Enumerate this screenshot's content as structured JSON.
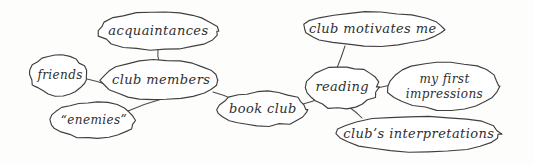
{
  "diagram": {
    "background_color": "#fdfdfc",
    "stroke_color": "#3f3f3f",
    "text_color": "#2e2e2e",
    "style": "hand-drawn sketch",
    "width": 534,
    "height": 164
  },
  "nodes": [
    {
      "id": "acquaintances",
      "label": "acquaintances",
      "cx": 158,
      "cy": 31,
      "rx": 60,
      "ry": 19,
      "font_size": 13,
      "lines": [
        "acquaintances"
      ]
    },
    {
      "id": "friends",
      "label": "friends",
      "cx": 59,
      "cy": 75,
      "rx": 29,
      "ry": 20,
      "font_size": 12,
      "lines": [
        "friends"
      ]
    },
    {
      "id": "club-members",
      "label": "club members",
      "cx": 160,
      "cy": 80,
      "rx": 58,
      "ry": 20,
      "font_size": 13,
      "lines": [
        "club members"
      ]
    },
    {
      "id": "enemies",
      "label": "“enemies”",
      "cx": 93,
      "cy": 120,
      "rx": 42,
      "ry": 18,
      "font_size": 12,
      "lines": [
        "“enemies”"
      ]
    },
    {
      "id": "book-club",
      "label": "book club",
      "cx": 263,
      "cy": 109,
      "rx": 45,
      "ry": 17,
      "font_size": 13,
      "lines": [
        "book club"
      ]
    },
    {
      "id": "club-motivates-me",
      "label": "club motivates me",
      "cx": 373,
      "cy": 29,
      "rx": 70,
      "ry": 17,
      "font_size": 13,
      "lines": [
        "club motivates me"
      ]
    },
    {
      "id": "reading",
      "label": "reading",
      "cx": 342,
      "cy": 87,
      "rx": 36,
      "ry": 21,
      "font_size": 13,
      "lines": [
        "reading"
      ]
    },
    {
      "id": "my-first-impressions",
      "label": "my first impressions",
      "cx": 444,
      "cy": 86,
      "rx": 56,
      "ry": 24,
      "font_size": 12,
      "lines": [
        "my first",
        "impressions"
      ]
    },
    {
      "id": "clubs-interpretations",
      "label": "club's interpretations",
      "cx": 419,
      "cy": 134,
      "rx": 82,
      "ry": 18,
      "font_size": 13,
      "lines": [
        "club’s interpretations"
      ]
    }
  ],
  "edges": [
    {
      "id": "acquaintances--club-members",
      "from": "acquaintances",
      "to": "club-members",
      "x1": 158,
      "y1": 50,
      "x2": 159,
      "y2": 61
    },
    {
      "id": "friends--club-members",
      "from": "friends",
      "to": "club-members",
      "x1": 87,
      "y1": 79,
      "x2": 108,
      "y2": 85
    },
    {
      "id": "enemies--club-members",
      "from": "enemies",
      "to": "club-members",
      "x1": 128,
      "y1": 111,
      "x2": 162,
      "y2": 99
    },
    {
      "id": "club-members--book-club",
      "from": "club-members",
      "to": "book-club",
      "x1": 213,
      "y1": 92,
      "x2": 232,
      "y2": 99
    },
    {
      "id": "book-club--reading",
      "from": "book-club",
      "to": "reading",
      "x1": 303,
      "y1": 104,
      "x2": 319,
      "y2": 99
    },
    {
      "id": "club-motivates-me--reading",
      "from": "club-motivates-me",
      "to": "reading",
      "x1": 345,
      "y1": 46,
      "x2": 337,
      "y2": 68
    },
    {
      "id": "reading--my-first-impressions",
      "from": "reading",
      "to": "my-first-impressions",
      "x1": 377,
      "y1": 88,
      "x2": 391,
      "y2": 85
    },
    {
      "id": "reading--clubs-interpretations",
      "from": "reading",
      "to": "clubs-interpretations",
      "x1": 349,
      "y1": 107,
      "x2": 362,
      "y2": 118
    }
  ]
}
